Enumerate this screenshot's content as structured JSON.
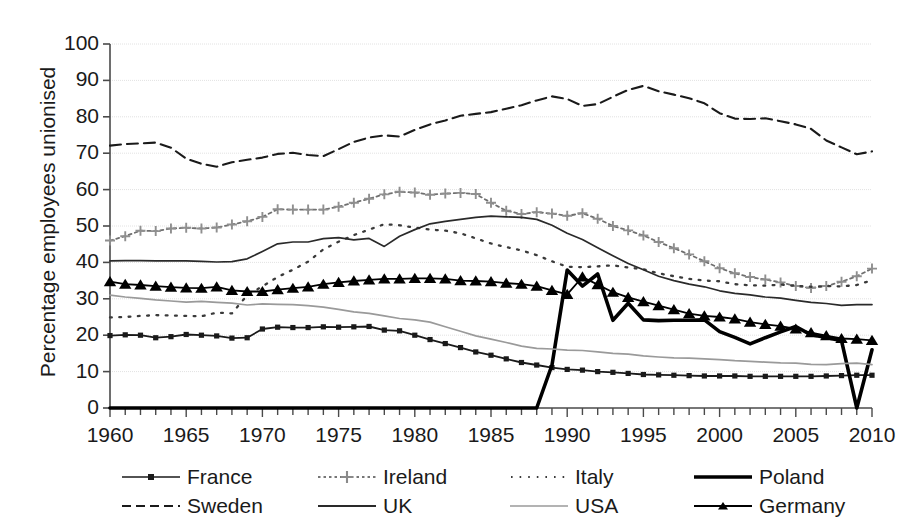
{
  "chart_data": {
    "type": "line",
    "title": "",
    "xlabel": "",
    "ylabel": "Percentage employees unionised",
    "xlim": [
      1960,
      2010
    ],
    "ylim": [
      0,
      100
    ],
    "ytick_labels": [
      "0",
      "10",
      "20",
      "30",
      "40",
      "50",
      "60",
      "70",
      "80",
      "90",
      "100"
    ],
    "ytick_values": [
      0,
      10,
      20,
      30,
      40,
      50,
      60,
      70,
      80,
      90,
      100
    ],
    "xtick_labels": [
      "1960",
      "1965",
      "1970",
      "1975",
      "1980",
      "1985",
      "1990",
      "1995",
      "2000",
      "2005",
      "2010"
    ],
    "xtick_values": [
      1960,
      1965,
      1970,
      1975,
      1980,
      1985,
      1990,
      1995,
      2000,
      2005,
      2010
    ],
    "x_minor_tick_interval": 1,
    "grid": true,
    "grid_axis": "y",
    "legend_position": "bottom",
    "x": [
      1960,
      1961,
      1962,
      1963,
      1964,
      1965,
      1966,
      1967,
      1968,
      1969,
      1970,
      1971,
      1972,
      1973,
      1974,
      1975,
      1976,
      1977,
      1978,
      1979,
      1980,
      1981,
      1982,
      1983,
      1984,
      1985,
      1986,
      1987,
      1988,
      1989,
      1990,
      1991,
      1992,
      1993,
      1994,
      1995,
      1996,
      1997,
      1998,
      1999,
      2000,
      2001,
      2002,
      2003,
      2004,
      2005,
      2006,
      2007,
      2008,
      2009,
      2010
    ],
    "series": [
      {
        "name": "France",
        "color": "#1a1a1a",
        "style": "solid-marker",
        "marker": "square",
        "values": [
          19.9,
          20.1,
          20.0,
          19.3,
          19.6,
          20.2,
          20.0,
          19.8,
          19.2,
          19.3,
          21.7,
          22.2,
          22.1,
          22.1,
          22.3,
          22.2,
          22.3,
          22.4,
          21.4,
          21.2,
          20.0,
          18.8,
          17.7,
          16.6,
          15.4,
          14.5,
          13.5,
          12.5,
          11.8,
          11.1,
          10.6,
          10.4,
          10.0,
          9.8,
          9.5,
          9.2,
          9.1,
          9.0,
          8.9,
          8.8,
          8.8,
          8.8,
          8.7,
          8.7,
          8.7,
          8.7,
          8.7,
          8.8,
          8.9,
          9.0,
          9.0
        ]
      },
      {
        "name": "Ireland",
        "color": "#6f6f6f",
        "style": "dotted-marker",
        "marker": "plus",
        "values": [
          46.0,
          47.2,
          48.7,
          48.6,
          49.3,
          49.5,
          49.3,
          49.6,
          50.4,
          51.3,
          52.5,
          54.6,
          54.5,
          54.5,
          54.5,
          55.3,
          56.4,
          57.5,
          58.7,
          59.4,
          59.2,
          58.6,
          58.9,
          59.1,
          58.8,
          56.4,
          54.2,
          53.3,
          53.8,
          53.4,
          52.8,
          53.5,
          52.0,
          50.0,
          48.8,
          47.4,
          45.6,
          43.9,
          42.2,
          40.3,
          38.4,
          37.0,
          36.0,
          35.3,
          34.5,
          33.5,
          33.0,
          33.5,
          34.7,
          36.2,
          38.3
        ]
      },
      {
        "name": "Italy",
        "color": "#3a3a3a",
        "style": "dotted",
        "marker": "none",
        "values": [
          24.9,
          25.0,
          25.3,
          25.5,
          25.4,
          25.3,
          25.2,
          26.2,
          26.0,
          31.0,
          33.4,
          36.0,
          38.0,
          40.2,
          43.6,
          45.7,
          47.5,
          49.0,
          50.5,
          50.2,
          49.6,
          49.0,
          48.7,
          48.0,
          46.6,
          45.2,
          44.2,
          43.3,
          42.0,
          40.3,
          38.8,
          38.7,
          38.9,
          39.2,
          38.6,
          38.1,
          37.0,
          36.2,
          35.5,
          35.0,
          34.8,
          34.0,
          33.7,
          33.6,
          33.9,
          33.6,
          33.3,
          33.5,
          33.4,
          33.8,
          35.1
        ]
      },
      {
        "name": "Poland",
        "color": "#000000",
        "style": "solid-thick",
        "marker": "none",
        "values": [
          0,
          0,
          0,
          0,
          0,
          0,
          0,
          0,
          0,
          0,
          0,
          0,
          0,
          0,
          0,
          0,
          0,
          0,
          0,
          0,
          0,
          0,
          0,
          0,
          0,
          0,
          0,
          0,
          0,
          11.8,
          37.9,
          33.5,
          36.8,
          24.1,
          28.8,
          24.2,
          24.0,
          24.1,
          24.1,
          24.2,
          21.0,
          19.4,
          17.6,
          19.3,
          20.9,
          22.4,
          20.1,
          19.4,
          18.5,
          0.0,
          16.0
        ]
      },
      {
        "name": "Sweden",
        "color": "#1a1a1a",
        "style": "dashed",
        "marker": "none",
        "values": [
          72.1,
          72.5,
          72.7,
          72.9,
          71.5,
          68.5,
          67.1,
          66.3,
          67.5,
          68.2,
          68.8,
          69.8,
          70.1,
          69.5,
          69.2,
          71.1,
          73.1,
          74.3,
          74.9,
          74.6,
          76.4,
          77.9,
          79.0,
          80.3,
          80.8,
          81.3,
          82.2,
          83.2,
          84.5,
          85.6,
          84.9,
          83.0,
          83.5,
          85.5,
          87.4,
          88.5,
          87.0,
          86.1,
          85.1,
          83.7,
          81.0,
          79.5,
          79.4,
          79.6,
          78.8,
          77.9,
          76.7,
          73.5,
          71.6,
          69.7,
          70.5
        ]
      },
      {
        "name": "UK",
        "color": "#2a2a2a",
        "style": "solid-thin",
        "marker": "none",
        "values": [
          40.4,
          40.5,
          40.5,
          40.4,
          40.4,
          40.4,
          40.3,
          40.1,
          40.2,
          41.0,
          43.0,
          45.1,
          45.6,
          45.6,
          46.5,
          46.8,
          46.2,
          46.6,
          44.4,
          47.2,
          49.0,
          50.6,
          51.3,
          51.8,
          52.4,
          52.7,
          52.5,
          52.4,
          51.8,
          50.2,
          48.0,
          46.3,
          44.0,
          41.8,
          39.7,
          38.0,
          36.2,
          35.0,
          34.0,
          33.3,
          32.2,
          31.5,
          31.1,
          30.5,
          30.2,
          29.6,
          29.0,
          28.7,
          28.2,
          28.4,
          28.4
        ]
      },
      {
        "name": "USA",
        "color": "#9a9a9a",
        "style": "solid-thin",
        "marker": "none",
        "values": [
          31.0,
          30.5,
          30.1,
          29.7,
          29.4,
          29.1,
          29.3,
          29.0,
          28.8,
          28.3,
          28.6,
          28.5,
          28.4,
          28.1,
          27.7,
          27.1,
          26.4,
          26.0,
          25.3,
          24.6,
          24.2,
          23.6,
          22.3,
          21.1,
          19.8,
          18.9,
          18.0,
          17.0,
          16.4,
          16.2,
          15.9,
          15.8,
          15.4,
          15.0,
          14.8,
          14.3,
          14.0,
          13.8,
          13.7,
          13.5,
          13.3,
          13.0,
          12.8,
          12.6,
          12.4,
          12.3,
          12.0,
          11.9,
          12.2,
          12.3,
          11.9
        ]
      },
      {
        "name": "Germany",
        "color": "#000000",
        "style": "solid-marker",
        "marker": "triangle",
        "values": [
          34.7,
          34.0,
          33.8,
          33.5,
          33.2,
          33.0,
          32.9,
          33.3,
          32.3,
          32.0,
          32.0,
          32.5,
          32.9,
          33.3,
          34.0,
          34.5,
          34.9,
          35.2,
          35.5,
          35.5,
          35.6,
          35.6,
          35.5,
          35.0,
          34.9,
          34.7,
          34.3,
          34.0,
          33.5,
          32.3,
          31.2,
          36.0,
          33.9,
          31.8,
          30.4,
          29.2,
          28.1,
          27.0,
          25.9,
          25.3,
          25.0,
          24.5,
          23.6,
          23.0,
          22.5,
          21.7,
          20.7,
          19.9,
          19.1,
          18.9,
          18.6
        ]
      }
    ]
  },
  "legend": {
    "row1": [
      {
        "label": "France",
        "sample": "solid-square-marker"
      },
      {
        "label": "Ireland",
        "sample": "dotted-plus-marker"
      },
      {
        "label": "Italy",
        "sample": "dotted"
      },
      {
        "label": "Poland",
        "sample": "solid-thick"
      }
    ],
    "row2": [
      {
        "label": "Sweden",
        "sample": "dashed"
      },
      {
        "label": "UK",
        "sample": "solid-thin"
      },
      {
        "label": "USA",
        "sample": "solid-light"
      },
      {
        "label": "Germany",
        "sample": "solid-triangle-marker"
      }
    ]
  }
}
